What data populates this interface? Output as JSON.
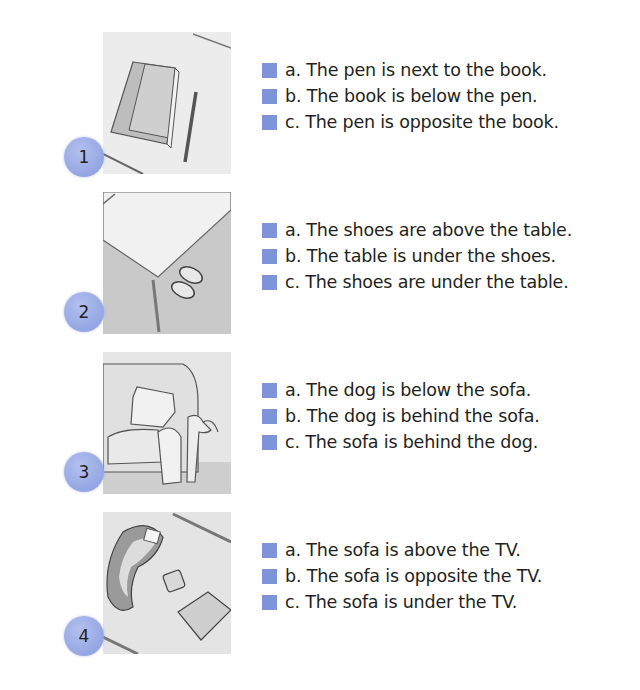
{
  "accent_color": "#7f93d9",
  "badge_color": "#9aaae4",
  "items": [
    {
      "number": "1",
      "illustration": "book-and-pen",
      "options": [
        {
          "letter": "a.",
          "text": "The pen is next to the book."
        },
        {
          "letter": "b.",
          "text": "The book is below the pen."
        },
        {
          "letter": "c.",
          "text": "The pen is opposite the book."
        }
      ]
    },
    {
      "number": "2",
      "illustration": "shoes-under-table",
      "options": [
        {
          "letter": "a.",
          "text": "The shoes are above the table."
        },
        {
          "letter": "b.",
          "text": "The table is under the shoes."
        },
        {
          "letter": "c.",
          "text": "The shoes are under the table."
        }
      ]
    },
    {
      "number": "3",
      "illustration": "dog-behind-sofa",
      "options": [
        {
          "letter": "a.",
          "text": "The dog is below the sofa."
        },
        {
          "letter": "b.",
          "text": "The dog is behind the sofa."
        },
        {
          "letter": "c.",
          "text": "The sofa is behind the dog."
        }
      ]
    },
    {
      "number": "4",
      "illustration": "sofa-opposite-tv",
      "options": [
        {
          "letter": "a.",
          "text": "The sofa is above the TV."
        },
        {
          "letter": "b.",
          "text": "The sofa is opposite the TV."
        },
        {
          "letter": "c.",
          "text": "The sofa is under the TV."
        }
      ]
    }
  ]
}
